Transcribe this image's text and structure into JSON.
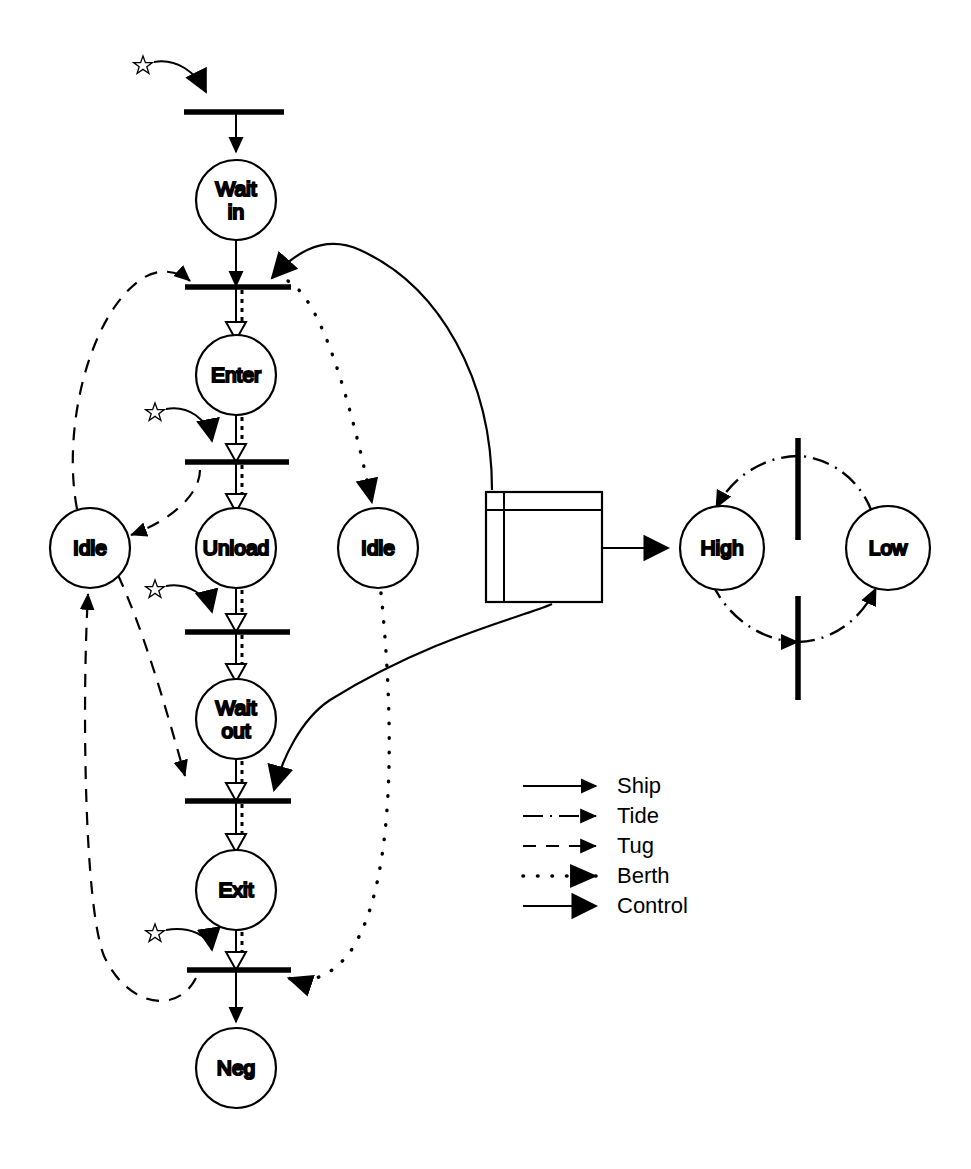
{
  "diagram": {
    "background_color": "#ffffff",
    "ink_color": "#000000",
    "width": 971,
    "height": 1169
  },
  "places": [
    {
      "id": "wait_in",
      "label_line1": "Wait",
      "label_line2": "in",
      "cx": 236,
      "cy": 200,
      "r": 40
    },
    {
      "id": "enter",
      "label_line1": "Enter",
      "label_line2": "",
      "cx": 236,
      "cy": 375,
      "r": 40
    },
    {
      "id": "unload",
      "label_line1": "Unload",
      "label_line2": "",
      "cx": 236,
      "cy": 548,
      "r": 40
    },
    {
      "id": "wait_out",
      "label_line1": "Wait",
      "label_line2": "out",
      "cx": 236,
      "cy": 719,
      "r": 40
    },
    {
      "id": "exit",
      "label_line1": "Exit",
      "label_line2": "",
      "cx": 236,
      "cy": 890,
      "r": 40
    },
    {
      "id": "neg",
      "label_line1": "Neg",
      "label_line2": "",
      "cx": 236,
      "cy": 1068,
      "r": 40
    },
    {
      "id": "tug_idle",
      "label_line1": "Idle",
      "label_line2": "",
      "cx": 90,
      "cy": 548,
      "r": 40
    },
    {
      "id": "berth_idle",
      "label_line1": "Idle",
      "label_line2": "",
      "cx": 378,
      "cy": 548,
      "r": 40
    },
    {
      "id": "tide_high",
      "label_line1": "High",
      "label_line2": "",
      "cx": 722,
      "cy": 548,
      "r": 42
    },
    {
      "id": "tide_low",
      "label_line1": "Low",
      "label_line2": "",
      "cx": 888,
      "cy": 548,
      "r": 42
    }
  ],
  "transitions": [
    {
      "id": "t_arrive",
      "x1": 184,
      "x2": 284,
      "y": 112,
      "orientation": "horizontal"
    },
    {
      "id": "t_enter",
      "x1": 185,
      "x2": 291,
      "y": 287,
      "orientation": "horizontal"
    },
    {
      "id": "t_unload",
      "x1": 185,
      "x2": 289,
      "y": 462,
      "orientation": "horizontal"
    },
    {
      "id": "t_waitout",
      "x1": 185,
      "x2": 290,
      "y": 632,
      "orientation": "horizontal"
    },
    {
      "id": "t_exit",
      "x1": 185,
      "x2": 291,
      "y": 801,
      "orientation": "horizontal"
    },
    {
      "id": "t_leave",
      "x1": 187,
      "x2": 291,
      "y": 970,
      "orientation": "horizontal"
    },
    {
      "id": "t_tide_up",
      "x": 798,
      "y1": 438,
      "y2": 540,
      "orientation": "vertical"
    },
    {
      "id": "t_tide_down",
      "x": 798,
      "y1": 596,
      "y2": 700,
      "orientation": "vertical"
    }
  ],
  "control_box": {
    "id": "controller",
    "x": 486,
    "y": 492,
    "w": 116,
    "h": 110,
    "inner_left_offset": 18,
    "inner_top_offset": 18
  },
  "stars": [
    {
      "id": "star-arrive",
      "cx": 143,
      "cy": 64,
      "targets": "t_arrive"
    },
    {
      "id": "star-unload",
      "cx": 155,
      "cy": 411,
      "targets": "t_unload"
    },
    {
      "id": "star-waitout",
      "cx": 155,
      "cy": 588,
      "targets": "t_waitout"
    },
    {
      "id": "star-leave",
      "cx": 155,
      "cy": 932,
      "targets": "t_leave"
    }
  ],
  "legend": {
    "x": 523,
    "y": 785,
    "items": [
      {
        "id": "legend-ship",
        "label": "Ship",
        "style": "solid-thin-arrow"
      },
      {
        "id": "legend-tide",
        "label": "Tide",
        "style": "dash-dot-arrow"
      },
      {
        "id": "legend-tug",
        "label": "Tug",
        "style": "dashed-arrow"
      },
      {
        "id": "legend-berth",
        "label": "Berth",
        "style": "dotted-arrow"
      },
      {
        "id": "legend-control",
        "label": "Control",
        "style": "solid-thick-arrow"
      }
    ]
  },
  "edges": {
    "ship": [
      {
        "from": "t_arrive",
        "to": "wait_in"
      },
      {
        "from": "wait_in",
        "to": "t_enter"
      },
      {
        "from": "t_enter",
        "to": "enter"
      },
      {
        "from": "enter",
        "to": "t_unload"
      },
      {
        "from": "t_unload",
        "to": "unload"
      },
      {
        "from": "unload",
        "to": "t_waitout"
      },
      {
        "from": "t_waitout",
        "to": "wait_out"
      },
      {
        "from": "wait_out",
        "to": "t_exit"
      },
      {
        "from": "t_exit",
        "to": "exit"
      },
      {
        "from": "exit",
        "to": "t_leave"
      },
      {
        "from": "t_leave",
        "to": "neg"
      }
    ],
    "tug": [
      {
        "from": "tug_idle",
        "to": "t_enter"
      },
      {
        "from": "t_unload",
        "to": "tug_idle"
      },
      {
        "from": "tug_idle",
        "to": "t_exit"
      },
      {
        "from": "t_leave",
        "to": "tug_idle"
      }
    ],
    "berth": [
      {
        "from": "t_enter",
        "to": "berth_idle"
      },
      {
        "from": "berth_idle",
        "to": "t_leave"
      }
    ],
    "control": [
      {
        "from": "controller",
        "to": "t_enter"
      },
      {
        "from": "controller",
        "to": "t_exit"
      },
      {
        "from": "controller",
        "to": "tide_high"
      }
    ],
    "tide": [
      {
        "from": "tide_low",
        "to": "t_tide_up",
        "then": "tide_high"
      },
      {
        "from": "tide_high",
        "to": "t_tide_down",
        "then": "tide_low"
      }
    ]
  }
}
